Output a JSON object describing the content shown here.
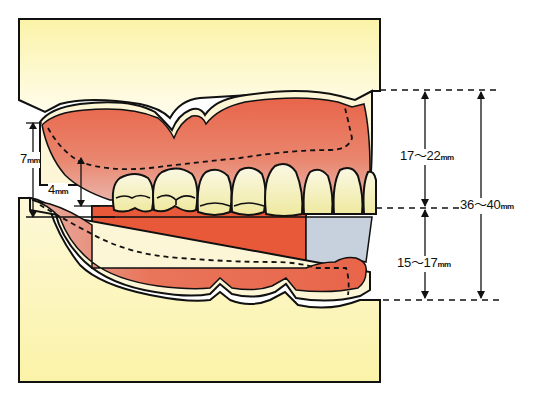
{
  "diagram": {
    "colors": {
      "background_top": "#fbf3a8",
      "background_fade": "#fffbe8",
      "background_bottom": "#fbf3a8",
      "gum": "#e8654a",
      "gum_light": "#e9a49a",
      "tooth": "#f4f0bf",
      "tooth_highlight": "#ffffff",
      "bite_block": "#e8593a",
      "blue_block": "#c7d0dd",
      "outline": "#111111"
    },
    "measurements": {
      "left_outer": {
        "value": "7",
        "unit": "mm"
      },
      "left_inner": {
        "value": "4",
        "unit": "mm"
      },
      "upper_right": {
        "value": "17～22",
        "unit": "mm"
      },
      "lower_right": {
        "value": "15～17",
        "unit": "mm"
      },
      "total_right": {
        "value": "36～40",
        "unit": "mm"
      }
    }
  }
}
